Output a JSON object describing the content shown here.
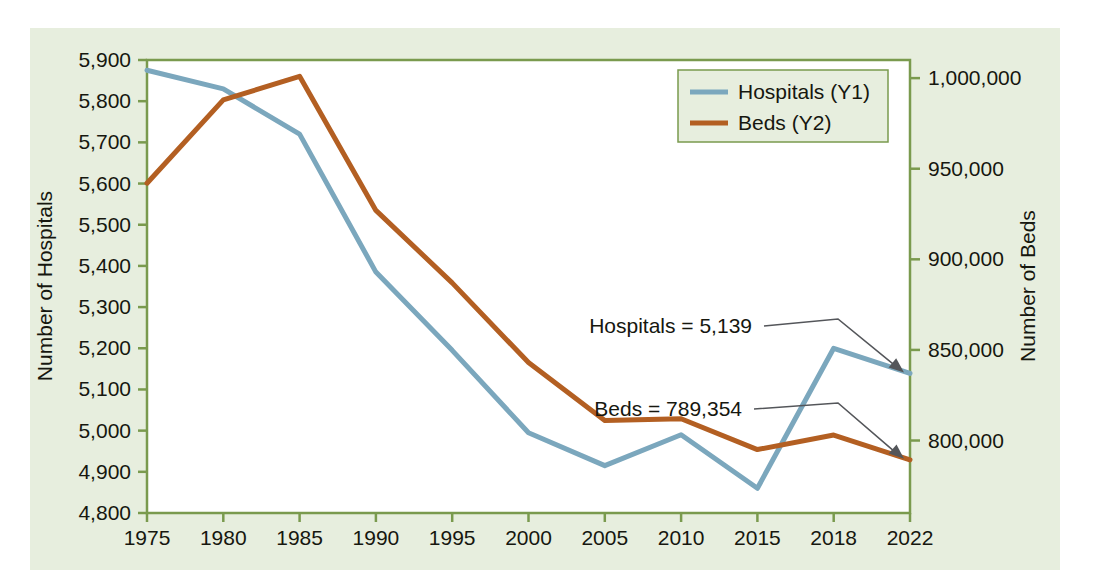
{
  "colors": {
    "panel_background": "#e7eede",
    "plot_background": "#ffffff",
    "axis_line": "#7a9a4e",
    "hospitals_line": "#7ba7bd",
    "beds_line": "#b35f22",
    "text": "#16170f",
    "annotation_line": "#54565a"
  },
  "chart_data": {
    "type": "line",
    "title": "",
    "xlabel": "",
    "ylabel": "Number of Hospitals",
    "y2label": "Number of Beds",
    "grid": false,
    "legend_position": "top-right",
    "categories": [
      "1975",
      "1980",
      "1985",
      "1990",
      "1995",
      "2000",
      "2005",
      "2010",
      "2015",
      "2018",
      "2022"
    ],
    "ylim": [
      4800,
      5900
    ],
    "y2lim": [
      760000,
      1010000
    ],
    "yticks": [
      "5,900",
      "5,800",
      "5,700",
      "5,600",
      "5,500",
      "5,400",
      "5,300",
      "5,200",
      "5,100",
      "5,000",
      "4,900",
      "4,800"
    ],
    "ytick_values": [
      5900,
      5800,
      5700,
      5600,
      5500,
      5400,
      5300,
      5200,
      5100,
      5000,
      4900,
      4800
    ],
    "y2ticks": [
      "1,000,000",
      "950,000",
      "900,000",
      "850,000",
      "800,000"
    ],
    "y2tick_values": [
      1000000,
      950000,
      900000,
      850000,
      800000
    ],
    "series": [
      {
        "name": "Hospitals (Y1)",
        "axis": "y1",
        "color": "#7ba7bd",
        "values": [
          5875,
          5830,
          5720,
          5385,
          5195,
          4995,
          4915,
          4990,
          4860,
          5200,
          5139
        ]
      },
      {
        "name": "Beds (Y2)",
        "axis": "y2",
        "color": "#b35f22",
        "values": [
          942000,
          988000,
          1001000,
          927000,
          887000,
          843000,
          811000,
          812000,
          795000,
          803000,
          789354
        ]
      }
    ],
    "annotations": [
      {
        "text": "Hospitals = 5,139",
        "target_category": "2022",
        "target_series": "Hospitals (Y1)"
      },
      {
        "text": "Beds = 789,354",
        "target_category": "2022",
        "target_series": "Beds (Y2)"
      }
    ]
  },
  "legend": {
    "items": [
      {
        "label": "Hospitals (Y1)",
        "color": "#7ba7bd"
      },
      {
        "label": "Beds (Y2)",
        "color": "#b35f22"
      }
    ]
  }
}
